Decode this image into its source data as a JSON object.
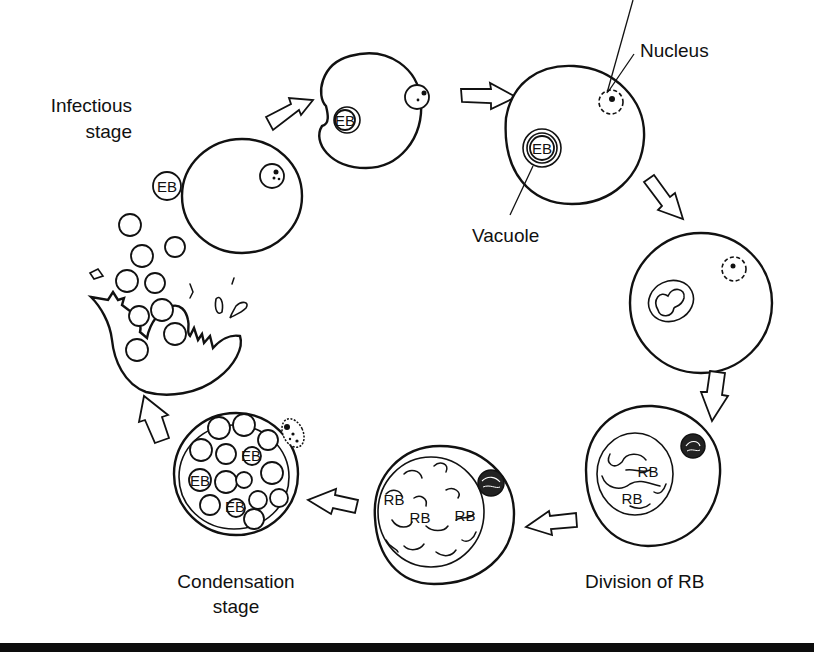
{
  "diagram": {
    "type": "life-cycle",
    "labels": {
      "infectious_stage_line1": "Infectious",
      "infectious_stage_line2": "stage",
      "nucleus": "Nucleus",
      "vacuole": "Vacuole",
      "division_of_rb": "Division of RB",
      "condensation_line1": "Condensation",
      "condensation_line2": "stage"
    },
    "inner_labels": {
      "eb": "EB",
      "rb": "RB"
    },
    "stages": [
      {
        "id": "attachment",
        "description": "EB attached to host cell"
      },
      {
        "id": "entry",
        "description": "EB entering cell via invagination"
      },
      {
        "id": "vacuole",
        "description": "EB within vacuole; nucleus labeled"
      },
      {
        "id": "conversion",
        "description": "EB converting to RB inside vacuole"
      },
      {
        "id": "division",
        "description": "Division of RB"
      },
      {
        "id": "multiplication",
        "description": "Inclusion filled with RBs"
      },
      {
        "id": "condensation",
        "description": "RBs condensing into EBs"
      },
      {
        "id": "release",
        "description": "Host cell ruptures releasing EBs"
      }
    ],
    "colors": {
      "ink": "#111111",
      "background": "#ffffff"
    }
  }
}
